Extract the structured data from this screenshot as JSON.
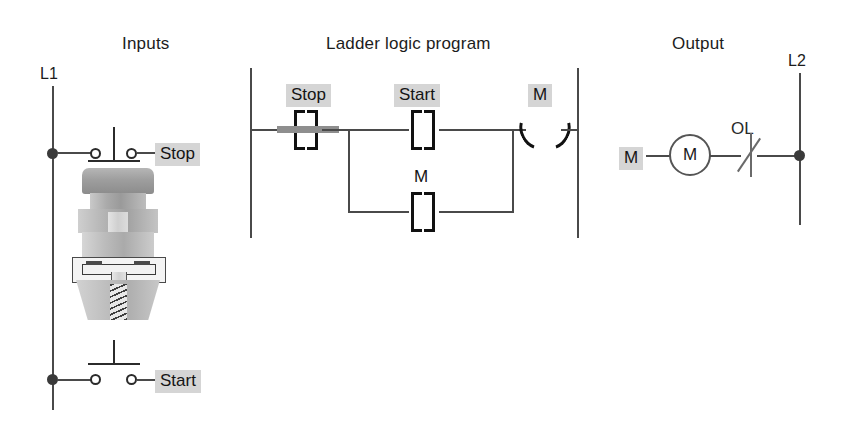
{
  "sections": {
    "inputs": {
      "title": "Inputs",
      "left_rail_label": "L1",
      "stop_label": "Stop",
      "start_label": "Start",
      "stop_type": "normally-closed-pushbutton",
      "start_type": "normally-open-pushbutton",
      "illustration": "pushbutton-switch-cutaway"
    },
    "ladder": {
      "title": "Ladder logic program",
      "rung1": {
        "stop_contact_label": "Stop",
        "stop_contact_type": "normally-closed",
        "stop_contact_energized": true,
        "start_contact_label": "Start",
        "start_contact_type": "normally-open",
        "coil_label": "M",
        "coil_type": "output-coil"
      },
      "branch": {
        "seal_in_contact_label": "M",
        "seal_in_contact_type": "normally-open"
      }
    },
    "output": {
      "title": "Output",
      "right_rail_label": "L2",
      "contact_label": "M",
      "motor_label": "M",
      "overload_label": "OL",
      "overload_type": "normally-closed"
    }
  },
  "colors": {
    "wire": "#4a4a4a",
    "symbol": "#111111",
    "tag_background": "#d5d5d5",
    "energized_bar": "#8e8e8e",
    "background": "#ffffff"
  }
}
